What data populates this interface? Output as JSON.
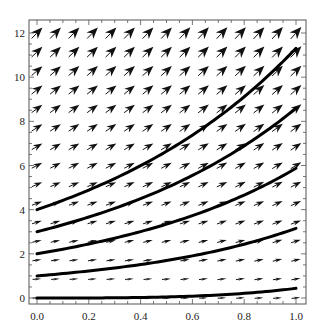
{
  "chart_data": {
    "type": "vector_field_with_solution_curves",
    "title": "",
    "xlabel": "",
    "ylabel": "",
    "xlim": [
      0.0,
      1.0
    ],
    "ylim": [
      0,
      12
    ],
    "x_ticks": [
      0.0,
      0.2,
      0.4,
      0.6,
      0.8,
      1.0
    ],
    "x_tick_labels": [
      "0.0",
      "0.2",
      "0.4",
      "0.6",
      "0.8",
      "1.0"
    ],
    "y_ticks": [
      0,
      2,
      4,
      6,
      8,
      10,
      12
    ],
    "y_tick_labels": [
      "0",
      "2",
      "4",
      "6",
      "8",
      "10",
      "12"
    ],
    "x_minor_step": 0.05,
    "y_minor_step": 0.5,
    "grid": false,
    "frame": true,
    "field": {
      "equation": "dy/dx = y + x^2",
      "grid_columns": 15,
      "grid_rows": 15,
      "arrow_style": "filled arrowhead, length scaled by magnitude",
      "color": "#111111"
    },
    "solution_curves": [
      {
        "y0": 0,
        "y_at_x1": 0.44,
        "formula": "(y0+2)e^x - x^2 - 2x - 2"
      },
      {
        "y0": 1,
        "y_at_x1": 3.15
      },
      {
        "y0": 2,
        "y_at_x1": 5.87
      },
      {
        "y0": 3,
        "y_at_x1": 8.59
      },
      {
        "y0": 4,
        "y_at_x1": 11.31
      }
    ],
    "curve_color": "#000000",
    "curve_width": 3
  },
  "layout": {
    "plot_left": 29,
    "plot_right": 306,
    "plot_top": 20,
    "plot_bottom": 304,
    "x0_px": 37,
    "x1_px": 296,
    "y0_px": 298,
    "y12_px": 33
  }
}
